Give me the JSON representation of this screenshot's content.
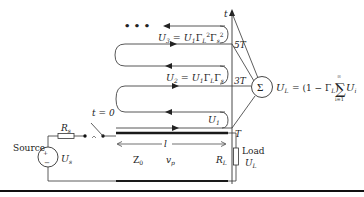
{
  "colors": {
    "line": "#333333",
    "thick_line": "#1a1a1a",
    "background": "#ffffff",
    "text": "#222222"
  },
  "time_axis": {
    "label": "t",
    "ticks": [
      {
        "label": "5T",
        "y": 44
      },
      {
        "label": "3T",
        "y": 80
      },
      {
        "label": "T",
        "y": 128
      }
    ]
  },
  "waves": {
    "u3": {
      "name": "U",
      "sub": "3",
      "eq": " = U",
      "sub1": "1",
      "gl": "Γ",
      "glsub": "L",
      "glsup": "2",
      "gs": "Γ",
      "gssub": "s",
      "gssup": "2"
    },
    "u2": {
      "name": "U",
      "sub": "2",
      "eq": " = U",
      "sub1": "1",
      "gl": "Γ",
      "glsub": "L",
      "gs": "Γ",
      "gssub": "s"
    },
    "u1": {
      "name": "U",
      "sub": "1"
    },
    "continuation": "• • •"
  },
  "summation": {
    "symbol": "Σ",
    "formula_lhs": "U",
    "formula_lhs_sub": "L",
    "formula_mid": " = (1 − Γ",
    "formula_mid_sub": "L",
    "formula_close": ")",
    "sum_symbol": "∑",
    "sum_upper": "∞",
    "sum_lower": "i=1",
    "sum_term": "U",
    "sum_term_sub": "i"
  },
  "circuit": {
    "source_label": "Source",
    "source_voltage": "U",
    "source_voltage_sub": "s",
    "source_plus": "+",
    "source_minus": "−",
    "series_resistor": "R",
    "series_resistor_sub": "s",
    "switch_label": "t = 0",
    "line_impedance": "Z",
    "line_impedance_sub": "0",
    "line_velocity": "v",
    "line_velocity_sub": "p",
    "line_length": "l",
    "load_resistor": "R",
    "load_resistor_sub": "L",
    "load_label": "Load",
    "load_voltage": "U",
    "load_voltage_sub": "L"
  }
}
